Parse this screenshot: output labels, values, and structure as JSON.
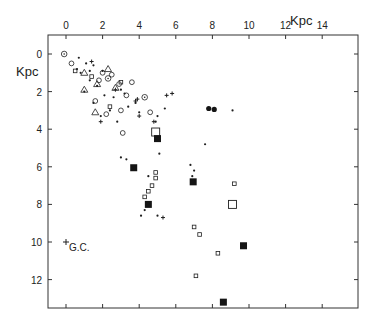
{
  "chart_data": {
    "type": "scatter",
    "title": "",
    "xlabel": "Kpc",
    "ylabel": "Kpc",
    "x_axis_position": "top",
    "y_axis_inverted": true,
    "xlim": [
      -1.0,
      16.0
    ],
    "ylim": [
      -1.0,
      13.7
    ],
    "x_ticks": [
      0,
      2,
      4,
      6,
      8,
      10,
      12,
      14
    ],
    "y_ticks": [
      0,
      2,
      4,
      6,
      8,
      10,
      12
    ],
    "x_tick_labels": [
      "0",
      "2",
      "4",
      "6",
      "8",
      "10",
      "12",
      "14"
    ],
    "y_tick_labels": [
      "0",
      "2",
      "4",
      "6",
      "8",
      "10",
      "12"
    ],
    "grid": false,
    "legend": null,
    "annotations": [
      {
        "text": "G.C.",
        "x": 0.0,
        "y": 10.0,
        "marker": "plus"
      }
    ],
    "series": [
      {
        "name": "open-circle-dot",
        "marker": "circle-dot",
        "points": [
          [
            -0.1,
            0.0
          ],
          [
            4.3,
            2.3
          ],
          [
            2.3,
            1.3
          ]
        ]
      },
      {
        "name": "small-dots",
        "marker": "dot",
        "points": [
          [
            0.7,
            0.2
          ],
          [
            1.1,
            0.5
          ],
          [
            0.6,
            0.8
          ],
          [
            1.5,
            0.6
          ],
          [
            2.0,
            0.9
          ],
          [
            1.3,
            1.4
          ],
          [
            0.8,
            1.0
          ],
          [
            1.7,
            1.7
          ],
          [
            1.0,
            2.0
          ],
          [
            2.1,
            2.2
          ],
          [
            1.5,
            2.6
          ],
          [
            2.6,
            2.3
          ],
          [
            3.0,
            1.9
          ],
          [
            3.2,
            2.1
          ],
          [
            3.8,
            2.6
          ],
          [
            2.4,
            3.0
          ],
          [
            1.9,
            3.3
          ],
          [
            2.8,
            3.6
          ],
          [
            3.4,
            2.8
          ],
          [
            4.0,
            3.1
          ],
          [
            5.0,
            3.3
          ],
          [
            5.4,
            2.9
          ],
          [
            3.0,
            5.5
          ],
          [
            3.3,
            5.6
          ],
          [
            4.5,
            6.5
          ],
          [
            5.1,
            5.3
          ],
          [
            6.8,
            5.9
          ],
          [
            7.0,
            6.2
          ],
          [
            6.9,
            6.5
          ],
          [
            4.3,
            8.3
          ],
          [
            4.1,
            8.6
          ],
          [
            5.0,
            8.6
          ],
          [
            9.1,
            3.0
          ],
          [
            7.6,
            4.8
          ],
          [
            4.9,
            3.6
          ],
          [
            1.3,
            0.9
          ]
        ]
      },
      {
        "name": "crosses",
        "marker": "plus",
        "points": [
          [
            1.4,
            0.4
          ],
          [
            2.7,
            1.9
          ],
          [
            3.9,
            2.4
          ],
          [
            4.0,
            3.3
          ],
          [
            4.8,
            3.6
          ],
          [
            5.5,
            2.2
          ],
          [
            5.8,
            2.1
          ],
          [
            1.9,
            3.6
          ],
          [
            3.8,
            2.5
          ],
          [
            5.3,
            8.7
          ]
        ]
      },
      {
        "name": "open-triangles",
        "marker": "triangle",
        "points": [
          [
            1.0,
            1.0
          ],
          [
            2.3,
            0.8
          ],
          [
            1.0,
            1.9
          ],
          [
            2.7,
            1.8
          ],
          [
            1.7,
            1.6
          ],
          [
            1.6,
            3.1
          ]
        ]
      },
      {
        "name": "small-open-circles",
        "marker": "circle",
        "points": [
          [
            0.3,
            0.5
          ],
          [
            2.0,
            1.0
          ],
          [
            2.5,
            1.1
          ],
          [
            1.8,
            1.4
          ],
          [
            3.3,
            2.2
          ],
          [
            3.0,
            3.0
          ],
          [
            4.6,
            3.1
          ],
          [
            2.9,
            1.6
          ],
          [
            3.1,
            4.2
          ],
          [
            1.6,
            2.5
          ],
          [
            2.2,
            3.2
          ],
          [
            3.6,
            1.5
          ]
        ]
      },
      {
        "name": "small-open-squares",
        "marker": "square-small",
        "points": [
          [
            0.5,
            0.9
          ],
          [
            1.4,
            1.2
          ],
          [
            3.0,
            1.5
          ],
          [
            2.4,
            2.8
          ],
          [
            4.9,
            6.3
          ],
          [
            4.9,
            6.6
          ],
          [
            4.5,
            7.3
          ],
          [
            4.3,
            7.6
          ],
          [
            4.7,
            7.0
          ],
          [
            9.2,
            6.9
          ],
          [
            7.0,
            9.2
          ],
          [
            7.3,
            9.6
          ],
          [
            8.3,
            10.6
          ],
          [
            7.1,
            11.8
          ]
        ]
      },
      {
        "name": "large-open-squares",
        "marker": "square-large",
        "points": [
          [
            4.9,
            4.15
          ],
          [
            9.1,
            8.0
          ]
        ]
      },
      {
        "name": "filled-squares",
        "marker": "square-filled",
        "points": [
          [
            5.0,
            4.5
          ],
          [
            3.7,
            6.05
          ],
          [
            6.95,
            6.8
          ],
          [
            4.5,
            8.0
          ],
          [
            9.7,
            10.2
          ],
          [
            8.6,
            13.2
          ]
        ]
      },
      {
        "name": "filled-circles",
        "marker": "circle-filled",
        "points": [
          [
            7.8,
            2.9
          ],
          [
            8.1,
            2.95
          ]
        ]
      }
    ]
  }
}
